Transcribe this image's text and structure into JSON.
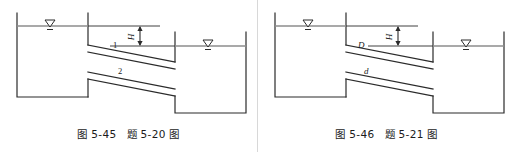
{
  "page": {
    "background_color": "#ffffff",
    "line_color": "#2b2b2b",
    "water_line_color": "#8c8c8c",
    "text_color": "#1b1b1b"
  },
  "figures": [
    {
      "id": "figure-left",
      "caption": "图 5-45　题 5-20 图",
      "figure_number": "图 5-45",
      "problem_number": "题 5-20 图",
      "head_label": "H",
      "pipe_labels": [
        "1",
        "2"
      ],
      "water_symbols": [
        {
          "name": "upstream-water-level",
          "label": "▽"
        },
        {
          "name": "downstream-water-level",
          "label": "▽"
        }
      ],
      "description": "Two parallel inclined pipes connecting an upper reservoir to a lower reservoir, head difference H"
    },
    {
      "id": "figure-right",
      "caption": "图 5-46　题 5-21 图",
      "figure_number": "图 5-46",
      "problem_number": "题 5-21 图",
      "head_label": "H",
      "pipe_labels": [
        "D",
        "d"
      ],
      "water_symbols": [
        {
          "name": "upstream-water-level",
          "label": "▽"
        },
        {
          "name": "downstream-water-level",
          "label": "▽"
        }
      ],
      "description": "Two parallel inclined pipes of diameters D and d connecting an upper reservoir to a lower reservoir, head difference H"
    }
  ]
}
